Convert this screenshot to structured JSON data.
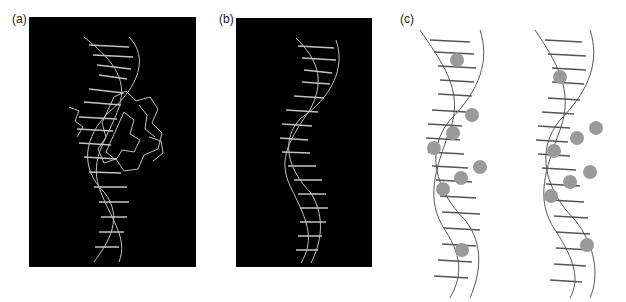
{
  "figure": {
    "panels": [
      {
        "id": "a",
        "label": "(a)",
        "description": "DNA double helix bound to protein, stick model, light on black background"
      },
      {
        "id": "b",
        "label": "(b)",
        "description": "DNA double helix alone, stick model, light on black background"
      },
      {
        "id": "c",
        "label": "(c)",
        "description": "Two DNA double helices, line drawings on white with grey shaded spheres marking contact sites"
      }
    ],
    "colors": {
      "panel_background": "#000000",
      "stick_light": "#d8d8d8",
      "stick_dark": "#555555",
      "sphere_fill": "#9a9a9a"
    }
  }
}
